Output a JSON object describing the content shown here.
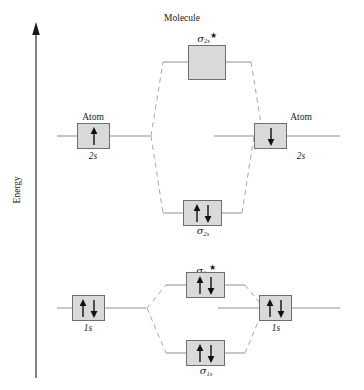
{
  "diagram": {
    "title": "Molecule",
    "axis_label": "Energy",
    "left_atom_label": "Atom",
    "right_atom_label": "Atom",
    "colors": {
      "box_fill": "#d9d9d9",
      "box_border": "#6e6e6e",
      "line": "#9a9a9a",
      "dashed_line": "#a8a8a8",
      "axis": "#1a1a1a",
      "text": "#1a1a1a",
      "arrow": "#111111"
    }
  },
  "levels": {
    "sigma_2s_star": {
      "symbol": "σ",
      "subscript": "2s",
      "star": "★",
      "electrons": [],
      "electron_count": 0,
      "type": "antibonding"
    },
    "sigma_2s": {
      "symbol": "σ",
      "subscript": "2s",
      "star": "",
      "electrons": [
        "up",
        "down"
      ],
      "electron_count": 2,
      "type": "bonding"
    },
    "atom_left_2s": {
      "shell_label": "2s",
      "atom_label": "Atom",
      "electrons": [
        "up"
      ],
      "electron_count": 1
    },
    "atom_right_2s": {
      "shell_label": "2s",
      "atom_label": "Atom",
      "electrons": [
        "down"
      ],
      "electron_count": 1
    },
    "sigma_1s_star": {
      "symbol": "σ",
      "subscript": "1s",
      "star": "★",
      "electrons": [
        "up",
        "down"
      ],
      "electron_count": 2,
      "type": "antibonding"
    },
    "sigma_1s": {
      "symbol": "σ",
      "subscript": "1s",
      "star": "",
      "electrons": [
        "up",
        "down"
      ],
      "electron_count": 2,
      "type": "bonding"
    },
    "atom_left_1s": {
      "shell_label": "1s",
      "electrons": [
        "up",
        "down"
      ],
      "electron_count": 2
    },
    "atom_right_1s": {
      "shell_label": "1s",
      "electrons": [
        "up",
        "down"
      ],
      "electron_count": 2
    }
  },
  "shell_labels": {
    "left_2s": "2s",
    "right_2s": "2s",
    "left_1s": "1s",
    "right_1s": "1s"
  }
}
